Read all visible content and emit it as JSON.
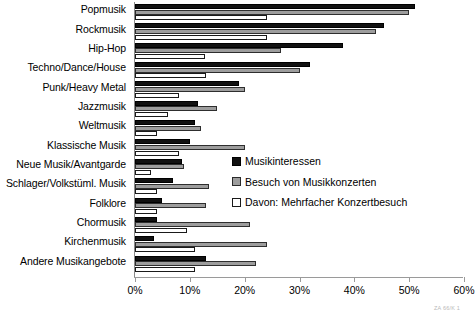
{
  "chart_data": {
    "type": "bar",
    "orientation": "horizontal",
    "title": "",
    "xlabel": "",
    "ylabel": "",
    "xlim": [
      0,
      60
    ],
    "xticks": [
      0,
      10,
      20,
      30,
      40,
      50,
      60
    ],
    "xtick_labels": [
      "0%",
      "10%",
      "20%",
      "30%",
      "40%",
      "50%",
      "60%"
    ],
    "grid": false,
    "legend_position": "center-right",
    "categories": [
      "Popmusik",
      "Rockmusik",
      "Hip-Hop",
      "Techno/Dance/House",
      "Punk/Heavy Metal",
      "Jazzmusik",
      "Weltmusik",
      "Klassische Musik",
      "Neue Musik/Avantgarde",
      "Schlager/Volkstüml. Musik",
      "Folklore",
      "Chormusik",
      "Kirchenmusik",
      "Andere Musikangebote"
    ],
    "series": [
      {
        "name": "Musikinteressen",
        "color": "#111111",
        "values": [
          51.0,
          45.5,
          38.0,
          32.0,
          19.0,
          11.5,
          11.0,
          10.0,
          8.5,
          7.0,
          5.0,
          4.0,
          3.5,
          13.0
        ]
      },
      {
        "name": "Besuch von Musikkonzerten",
        "color": "#9d9d9d",
        "values": [
          50.0,
          44.0,
          26.7,
          30.0,
          20.0,
          15.0,
          12.0,
          20.0,
          9.0,
          13.5,
          13.0,
          21.0,
          24.0,
          22.0
        ]
      },
      {
        "name": "Davon: Mehrfacher Konzertbesuch",
        "color": "#ffffff",
        "values": [
          24.0,
          24.0,
          12.7,
          13.0,
          8.0,
          6.0,
          4.0,
          8.0,
          3.0,
          4.0,
          4.0,
          9.5,
          11.0,
          11.0
        ]
      }
    ]
  },
  "legend": {
    "items": [
      {
        "label": "Musikinteressen",
        "swatch": "black-filled-square"
      },
      {
        "label": "Besuch von Musikkonzerten",
        "swatch": "gray-filled-square"
      },
      {
        "label": "Davon: Mehrfacher Konzertbesuch",
        "swatch": "white-outline-square"
      }
    ]
  },
  "source_note": "ZA 66/K 1"
}
